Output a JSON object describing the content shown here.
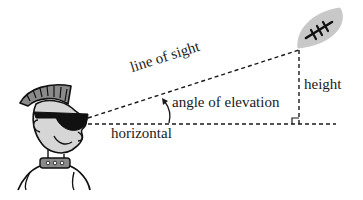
{
  "diagram": {
    "title": "Angle of elevation",
    "labels": {
      "line_of_sight": "line of sight",
      "angle": "angle of elevation",
      "horizontal": "horizontal",
      "height": "height"
    },
    "elements": {
      "observer": "cartoon person with mohawk and sunglasses",
      "target": "football in the air",
      "right_angle_marker": "right angle at base of height"
    },
    "colors": {
      "line": "#1a1a1a",
      "football_fill": "#c8c8c8",
      "skin_fill": "#d6d6d6",
      "hair_fill": "#8a8a8a"
    }
  }
}
